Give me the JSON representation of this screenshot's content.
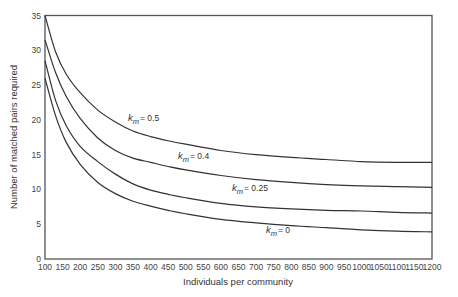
{
  "chart_data": {
    "type": "line",
    "title": "",
    "xlabel": "Individuals per community",
    "ylabel": "Number of matched pairs required",
    "xlim": [
      100,
      1200
    ],
    "ylim": [
      0,
      35
    ],
    "grid": false,
    "legend": "inline curve labels",
    "x_ticks": [
      100,
      150,
      200,
      250,
      300,
      350,
      400,
      450,
      500,
      550,
      600,
      650,
      700,
      750,
      800,
      850,
      900,
      950,
      1000,
      1050,
      1100,
      1150,
      1200
    ],
    "y_ticks": [
      0,
      5,
      10,
      15,
      20,
      25,
      30,
      35
    ],
    "x": [
      100,
      130,
      160,
      200,
      250,
      300,
      350,
      400,
      450,
      500,
      600,
      700,
      800,
      900,
      1000,
      1100,
      1200
    ],
    "series": [
      {
        "name": "k_m = 0.5",
        "label_sym": "k",
        "label_sub": "m",
        "label_val": "= 0.5",
        "values": [
          35.0,
          29.8,
          26.6,
          23.9,
          21.4,
          19.7,
          18.4,
          17.6,
          17.0,
          16.5,
          15.6,
          15.0,
          14.6,
          14.3,
          14.0,
          13.9,
          13.9
        ],
        "label_pos": [
          128,
          121
        ]
      },
      {
        "name": "k_m = 0.4",
        "label_sym": "k",
        "label_sub": "m",
        "label_val": "= 0.4",
        "values": [
          31.5,
          26.8,
          23.4,
          20.2,
          17.4,
          15.6,
          14.5,
          13.9,
          13.3,
          12.8,
          12.0,
          11.4,
          11.0,
          10.7,
          10.5,
          10.4,
          10.3
        ],
        "label_pos": [
          178,
          159
        ]
      },
      {
        "name": "k_m = 0.25",
        "label_sym": "k",
        "label_sub": "m",
        "label_val": "= 0.25",
        "values": [
          28.5,
          22.8,
          19.2,
          16.2,
          14.0,
          12.2,
          10.8,
          9.9,
          9.3,
          8.8,
          8.0,
          7.5,
          7.2,
          7.0,
          6.9,
          6.7,
          6.6
        ],
        "label_pos": [
          232,
          191
        ]
      },
      {
        "name": "k_m = 0",
        "label_sym": "k",
        "label_sub": "m",
        "label_val": "= 0",
        "values": [
          26.0,
          20.6,
          16.8,
          13.6,
          11.0,
          9.4,
          8.3,
          7.6,
          7.0,
          6.5,
          5.7,
          5.2,
          4.8,
          4.5,
          4.2,
          4.0,
          3.9
        ],
        "label_pos": [
          266,
          233
        ]
      }
    ]
  }
}
